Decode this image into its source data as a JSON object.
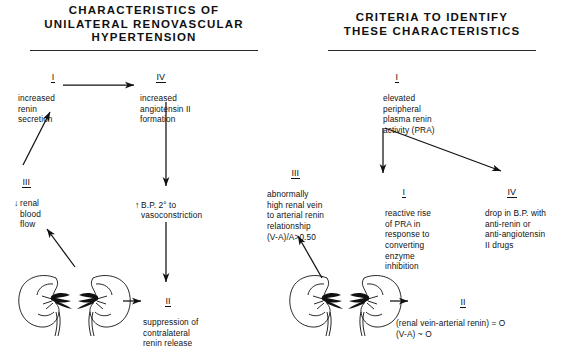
{
  "left_panel": {
    "title": "CHARACTERISTICS OF\nUNILATERAL RENOVASCULAR\nHYPERTENSION",
    "nodes": {
      "increased_renin": {
        "numeral": "I",
        "text": "increased\nrenin\nsecretion"
      },
      "angiotensin": {
        "numeral": "IV",
        "text": "increased\nangiotensin II\nformation"
      },
      "renal_blood_flow": {
        "numeral": "III",
        "arrow": "↓",
        "text": "renal\nblood\nflow"
      },
      "blood_pressure": {
        "numeral": "",
        "arrow": "↑",
        "text": "B.P. 2° to\nvasoconstriction"
      },
      "suppression": {
        "numeral": "II",
        "text": "suppression of\ncontralateral\nrenin release"
      }
    },
    "kidney_pair_label": "kidney-pair-illustration"
  },
  "right_panel": {
    "title": "CRITERIA TO IDENTIFY\nTHESE CHARACTERISTICS",
    "nodes": {
      "elevated_pra": {
        "numeral": "I",
        "text": "elevated\nperipheral\nplasma renin\nactivity (PRA)"
      },
      "reactive_rise": {
        "numeral": "I",
        "text": "reactive rise\nof PRA in\nresponse to\nconverting\nenzyme\ninhibition"
      },
      "drop_in_bp": {
        "numeral": "IV",
        "text": "drop in B.P. with\nanti-renin or\nanti-angiotensin\nII drugs"
      },
      "renal_vein_ratio": {
        "numeral": "III",
        "text": "abnormally\nhigh renal vein\nto arterial renin\nrelationship\n(V-A)/A>0.50"
      },
      "renin_difference": {
        "numeral": "II",
        "text": "(renal vein-arterial renin) = O\n(V-A) ~ O"
      }
    },
    "kidney_pair_label": "kidney-pair-illustration"
  },
  "colors": {
    "ink": "#111111",
    "rule": "#2a2a2a",
    "background": "#ffffff"
  }
}
